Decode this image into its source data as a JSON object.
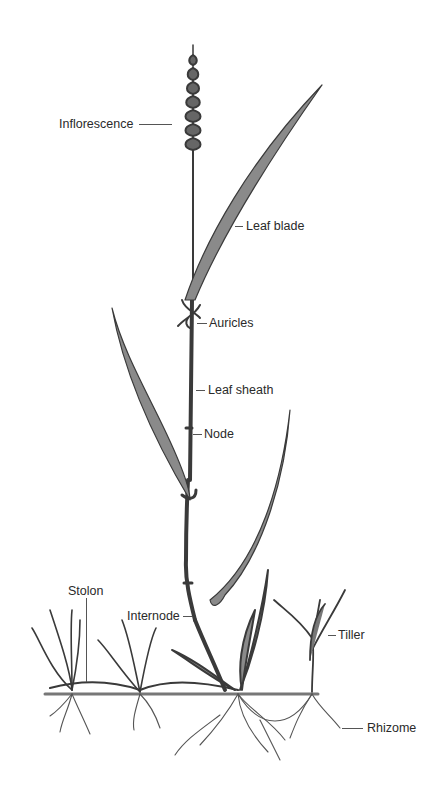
{
  "diagram": {
    "colors": {
      "ink": "#2a2a2a",
      "stroke": "#3a3a3a",
      "background": "#ffffff"
    },
    "labels": [
      {
        "id": "inflorescence",
        "text": "Inflorescence"
      },
      {
        "id": "leaf_blade",
        "text": "Leaf blade"
      },
      {
        "id": "auricles",
        "text": "Auricles"
      },
      {
        "id": "leaf_sheath",
        "text": "Leaf sheath"
      },
      {
        "id": "node",
        "text": "Node"
      },
      {
        "id": "stolon",
        "text": "Stolon"
      },
      {
        "id": "internode",
        "text": "Internode"
      },
      {
        "id": "tiller",
        "text": "Tiller"
      },
      {
        "id": "rhizome",
        "text": "Rhizome"
      }
    ]
  }
}
